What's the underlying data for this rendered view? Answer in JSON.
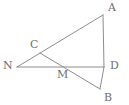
{
  "figure": {
    "width": 129,
    "height": 105,
    "background_color": "#ffffff",
    "line_color": "#8d8d8d",
    "label_color": "#6f6f6f",
    "points": {
      "A": {
        "label": "A",
        "x": 103,
        "y": 15,
        "label_x": 108,
        "label_y": 2
      },
      "B": {
        "label": "B",
        "x": 100,
        "y": 89,
        "label_x": 104,
        "label_y": 92
      },
      "C": {
        "label": "C",
        "x": 40,
        "y": 53,
        "label_x": 30,
        "label_y": 39
      },
      "D": {
        "label": "D",
        "x": 104,
        "y": 67,
        "label_x": 110,
        "label_y": 60
      },
      "M": {
        "label": "M",
        "x": 62,
        "y": 67,
        "label_x": 57,
        "label_y": 69
      },
      "N": {
        "label": "N",
        "x": 17,
        "y": 67,
        "label_x": 3,
        "label_y": 60
      }
    },
    "segments": [
      {
        "name": "segment-N-A",
        "from": "N",
        "to": "A"
      },
      {
        "name": "segment-A-D",
        "from": "A",
        "to": "D"
      },
      {
        "name": "segment-D-B",
        "from": "D",
        "to": "B"
      },
      {
        "name": "segment-N-D",
        "from": "N",
        "to": "D"
      },
      {
        "name": "segment-C-B",
        "from": "C",
        "to": "B"
      }
    ]
  }
}
